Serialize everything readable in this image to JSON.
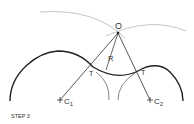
{
  "diagram": {
    "caption": "STEP 3",
    "points": {
      "O": {
        "label": "O"
      },
      "C1": {
        "label": "C",
        "sub": "1"
      },
      "C2": {
        "label": "C",
        "sub": "2"
      },
      "T_left": {
        "label": "T"
      },
      "T_right": {
        "label": "T"
      }
    },
    "radius_label": "R",
    "colors": {
      "heavy_line": "#222222",
      "construction_line": "#555555",
      "light_arc": "#b0b0b0"
    }
  }
}
